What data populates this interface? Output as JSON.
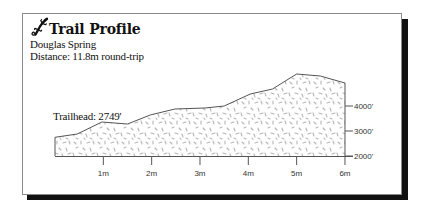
{
  "header": {
    "icon": "lizard-icon",
    "title": "Trail Profile",
    "trail_name": "Douglas Spring",
    "distance": "Distance:  11.8m round-trip"
  },
  "annotation": {
    "trailhead": "Trailhead: 2749'"
  },
  "colors": {
    "outline": "#555555",
    "speckle": "#b5b5b5",
    "shadow": "#111111",
    "border": "#8a8a8a"
  },
  "chart_data": {
    "type": "area",
    "title": "Trail Profile",
    "subtitle": "Douglas Spring — Distance: 11.8m round-trip",
    "xlabel": "Distance (miles)",
    "ylabel": "Elevation (ft)",
    "x_ticks": [
      "1m",
      "2m",
      "3m",
      "4m",
      "5m",
      "6m"
    ],
    "y_ticks": [
      "2000'",
      "3000'",
      "4000'"
    ],
    "xlim": [
      0,
      6
    ],
    "ylim": [
      2000,
      5300
    ],
    "y_axis_position": "right",
    "grid": false,
    "legend": null,
    "annotations": [
      {
        "text": "Trailhead: 2749'",
        "x": 0,
        "y": 2749
      }
    ],
    "series": [
      {
        "name": "Elevation",
        "x": [
          0,
          0.46,
          0.97,
          1.5,
          1.97,
          2.48,
          3.1,
          3.5,
          4.04,
          4.5,
          5.0,
          5.49,
          6.0
        ],
        "values": [
          2749,
          2880,
          3360,
          3280,
          3640,
          3880,
          3920,
          4000,
          4480,
          4680,
          5280,
          5200,
          4920
        ]
      }
    ]
  }
}
